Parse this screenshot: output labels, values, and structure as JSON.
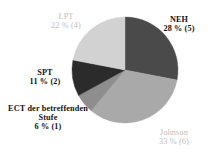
{
  "chart_data": {
    "type": "pie",
    "title": "",
    "subtitle": "",
    "xlabel": "",
    "ylabel": "",
    "legend_position": "none",
    "grid": false,
    "start_angle_deg": 0,
    "direction": "clockwise",
    "center": {
      "x": 125,
      "y": 70
    },
    "radius": 53,
    "total_count": 18,
    "categories": [
      "NEH",
      "Johnson",
      "ECT der betreffenden Stufe",
      "SPT",
      "LPT"
    ],
    "values": [
      28,
      33,
      6,
      11,
      22
    ],
    "counts": [
      5,
      6,
      1,
      2,
      4
    ],
    "value_unit": "%",
    "slices": [
      {
        "name": "NEH",
        "label_line1": "NEH",
        "label_line2": "28 % (5)",
        "percent": 28,
        "count": 5,
        "color": "#4a4a4a",
        "label_style": "strong",
        "start_deg": 0,
        "end_deg": 100.8
      },
      {
        "name": "Johnson",
        "label_line1": "Johnson",
        "label_line2": "33 % (6)",
        "percent": 33,
        "count": 6,
        "color": "#a9a9a9",
        "label_style": "faint",
        "start_deg": 100.8,
        "end_deg": 219.6
      },
      {
        "name": "ECT der betreffenden Stufe",
        "label_line1": "ECT der betreffenden Stufe",
        "label_line2": "6 % (1)",
        "percent": 6,
        "count": 1,
        "color": "#8e8e8e",
        "label_style": "strong",
        "start_deg": 219.6,
        "end_deg": 241.2
      },
      {
        "name": "SPT",
        "label_line1": "SPT",
        "label_line2": "11 % (2)",
        "percent": 11,
        "count": 2,
        "color": "#2b2b2b",
        "label_style": "strong",
        "start_deg": 241.2,
        "end_deg": 280.8
      },
      {
        "name": "LPT",
        "label_line1": "LPT",
        "label_line2": "22 % (4)",
        "percent": 22,
        "count": 4,
        "color": "#d2d2d2",
        "label_style": "faint",
        "start_deg": 280.8,
        "end_deg": 360
      }
    ],
    "colors": {
      "neh": "#4a4a4a",
      "johnson": "#a9a9a9",
      "ect": "#8e8e8e",
      "spt": "#2b2b2b",
      "lpt": "#d2d2d2",
      "background": "#ffffff",
      "strong_text": "#111111",
      "faint_text": "#bdbdbd"
    }
  }
}
